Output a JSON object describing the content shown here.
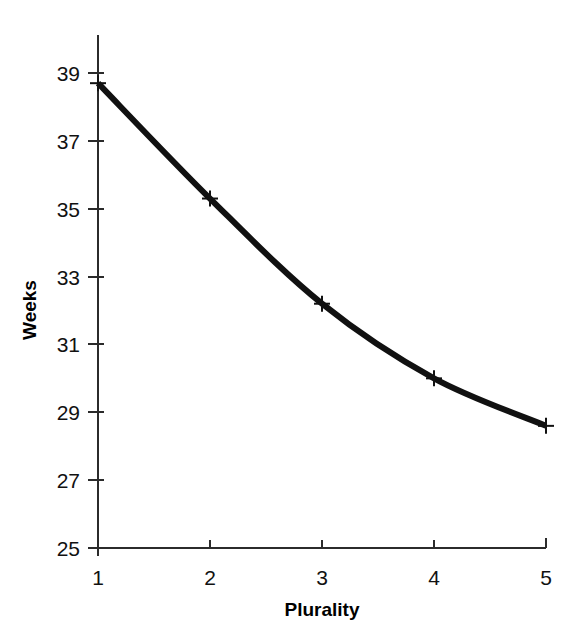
{
  "chart_data": {
    "type": "line",
    "title": "",
    "subtitle": "",
    "xlabel": "Plurality",
    "ylabel": "Weeks",
    "x": [
      1,
      2,
      3,
      4,
      5
    ],
    "values": [
      38.7,
      35.3,
      32.2,
      30.0,
      28.6
    ],
    "series": [
      {
        "name": "Mean gestation",
        "x": [
          1,
          2,
          3,
          4,
          5
        ],
        "values": [
          38.7,
          35.3,
          32.2,
          30.0,
          28.6
        ]
      }
    ],
    "xlim": [
      1,
      5
    ],
    "ylim": [
      25,
      39
    ],
    "xticks": [
      1,
      2,
      3,
      4,
      5
    ],
    "yticks": [
      25,
      27,
      29,
      31,
      33,
      35,
      37,
      39
    ],
    "xtick_labels": [
      "1",
      "2",
      "3",
      "4",
      "5"
    ],
    "ytick_labels": [
      "25",
      "27",
      "29",
      "31",
      "33",
      "35",
      "37",
      "39"
    ],
    "grid": false,
    "legend": false,
    "legend_position": "none",
    "marker": "plus",
    "line_color": "#111111",
    "marker_color": "#111111",
    "background_color": "#ffffff",
    "annotations": []
  },
  "axes": {
    "y": {
      "label": "Weeks",
      "ticks": [
        {
          "value": 39,
          "label": "39"
        },
        {
          "value": 37,
          "label": "37"
        },
        {
          "value": 35,
          "label": "35"
        },
        {
          "value": 33,
          "label": "33"
        },
        {
          "value": 31,
          "label": "31"
        },
        {
          "value": 29,
          "label": "29"
        },
        {
          "value": 27,
          "label": "27"
        },
        {
          "value": 25,
          "label": "25"
        }
      ]
    },
    "x": {
      "label": "Plurality",
      "ticks": [
        {
          "value": 1,
          "label": "1"
        },
        {
          "value": 2,
          "label": "2"
        },
        {
          "value": 3,
          "label": "3"
        },
        {
          "value": 4,
          "label": "4"
        },
        {
          "value": 5,
          "label": "5"
        }
      ]
    }
  }
}
